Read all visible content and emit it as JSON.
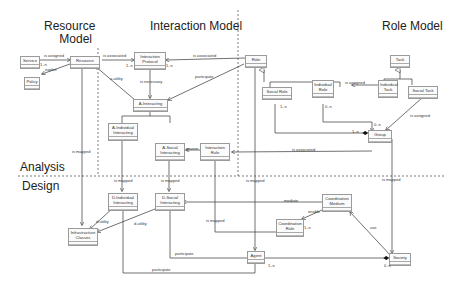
{
  "headings": {
    "resource_model": "Resource Model",
    "interaction_model": "Interaction Model",
    "role_model": "Role Model",
    "analysis": "Analysis",
    "design": "Design"
  },
  "classes": {
    "service": "Service",
    "policy": "Policy",
    "resource": "Resource",
    "interaction_protocol": "Interaction Protocol",
    "a_interacting": "A-Interacting",
    "a_individual_interacting": "A-Individual Interacting",
    "a_social_interacting": "A-Social Interacting",
    "interaction_rule": "Interaction Rule",
    "role": "Role",
    "social_role": "Social Role",
    "individual_role": "Individual Role",
    "task": "Task",
    "individual_task": "Individual Task",
    "social_task": "Social Task",
    "group": "Group",
    "d_individual_interacting": "D-Individual Interacting",
    "d_social_interacting": "D-Social Interacting",
    "infrastructure_classes": "Infrastructure Classes",
    "coordination_medium": "Coordination Medium",
    "coordination_rule": "Coordination Rule",
    "agent": "Agent",
    "society": "Society"
  },
  "relations": {
    "is_assigned_service": "is assigned",
    "mult_service": "1..n",
    "exploit": "exploit",
    "is_associated_resource": "is associated",
    "mult_ip_left": "1..n",
    "is_associated_role": "is associated",
    "mult_ip_right": "1..n",
    "a_utility": "a-utility",
    "is_necessary": "is necessary",
    "participate_role": "participate",
    "govern": "govern",
    "mult_social_role": "1..n",
    "is_assigned_task": "is assigned",
    "mult_individual_role": "0..n",
    "is_assigned_social_task": "is assigned",
    "mult_group_top": "0..n",
    "mult_group_left": "1..n",
    "is_associated_group": "is associated",
    "map_resource": "is mapped",
    "map_a_individual": "is mapped",
    "map_a_social": "is mapped",
    "map_role": "is mapped",
    "map_group": "is mapped",
    "map_interaction_rule": "is mapped",
    "d_utility_1": "d-utility",
    "d_utility_2": "d-utility",
    "mediate": "mediate",
    "enable": "enable",
    "mult_coord_rule": "1..n",
    "use": "use",
    "participate_1": "participate",
    "participate_2": "participate",
    "mult_agent": "1..n",
    "mult_society": "0..n"
  }
}
